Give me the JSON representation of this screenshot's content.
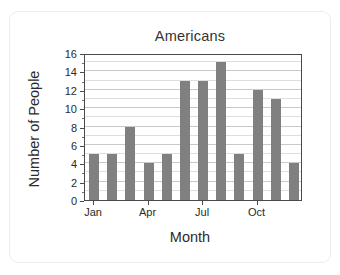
{
  "chart_data": {
    "type": "bar",
    "title": "Americans",
    "xlabel": "Month",
    "ylabel": "Number of People",
    "categories": [
      "Jan",
      "Feb",
      "Mar",
      "Apr",
      "May",
      "Jun",
      "Jul",
      "Aug",
      "Sep",
      "Oct",
      "Nov",
      "Dec"
    ],
    "values": [
      5,
      5,
      8,
      4,
      5,
      13,
      13,
      15,
      5,
      12,
      11,
      4
    ],
    "ylim": [
      0,
      16
    ],
    "ytick_labels": [
      "0",
      "2",
      "4",
      "6",
      "8",
      "10",
      "12",
      "14",
      "16"
    ],
    "ytick_values": [
      0,
      2,
      4,
      6,
      8,
      10,
      12,
      14,
      16
    ],
    "xtick_labels": [
      "Jan",
      "Apr",
      "Jul",
      "Oct"
    ],
    "xtick_categories": [
      0,
      3,
      6,
      9
    ],
    "grid": true,
    "legend": "none",
    "bar_color": "#808080",
    "axis_color": "#4a4a4a",
    "grid_color": "#c9c9c9",
    "background_color": "#ffffff",
    "card_border_color": "#ededed"
  }
}
